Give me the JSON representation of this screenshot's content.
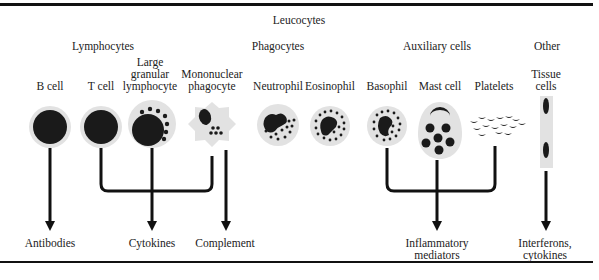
{
  "title": "Leucocytes",
  "groups": [
    {
      "label": "Lymphocytes"
    },
    {
      "label": "Phagocytes"
    },
    {
      "label": "Auxiliary cells"
    },
    {
      "label": "Other"
    }
  ],
  "cells": [
    {
      "label_lines": [
        "B cell"
      ]
    },
    {
      "label_lines": [
        "T cell"
      ]
    },
    {
      "label_lines": [
        "Large",
        "granular",
        "lymphocyte"
      ]
    },
    {
      "label_lines": [
        "Mononuclear",
        "phagocyte"
      ]
    },
    {
      "label_lines": [
        "Neutrophil"
      ]
    },
    {
      "label_lines": [
        "Eosinophil"
      ]
    },
    {
      "label_lines": [
        "Basophil"
      ]
    },
    {
      "label_lines": [
        "Mast cell"
      ]
    },
    {
      "label_lines": [
        "Platelets"
      ]
    },
    {
      "label_lines": [
        "Tissue",
        "cells"
      ]
    }
  ],
  "products": [
    {
      "label_lines": [
        "Antibodies"
      ]
    },
    {
      "label_lines": [
        "Cytokines"
      ]
    },
    {
      "label_lines": [
        "Complement"
      ]
    },
    {
      "label_lines": [
        "Inflammatory",
        "mediators"
      ]
    },
    {
      "label_lines": [
        "Interferons,",
        "cytokines"
      ]
    }
  ],
  "colors": {
    "cell_halo": "#e2e2e2",
    "nucleus": "#1a1a1a",
    "line": "#111111"
  }
}
